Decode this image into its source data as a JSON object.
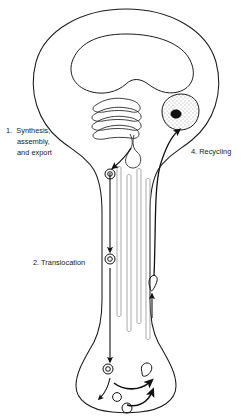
{
  "figure": {
    "background_color": "#ffffff",
    "line_color": "#1a1a1a",
    "text_color": "#1a1a1a"
  },
  "labels": {
    "step1": {
      "line1": "1.  Synthesis,",
      "line2": "assembly,",
      "line3": "and export"
    },
    "step2": {
      "line1": "2. Translocation"
    },
    "step4": {
      "line1": "4. Recycling"
    }
  },
  "structures": {
    "cell_body": "soma-outline",
    "nucleus": "nucleus-outline",
    "golgi": "golgi-apparatus",
    "lysosome": "lysosome",
    "axon": "axon-outline",
    "terminal": "axon-terminal",
    "microtubules": "microtubule-bundle",
    "anterograde_arrow": "anterograde-transport-arrow",
    "retrograde_arrow": "retrograde-transport-arrow",
    "vesicles": "transport-vesicles"
  }
}
